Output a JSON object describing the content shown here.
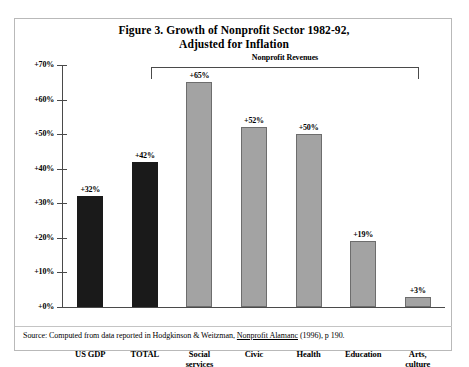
{
  "figure": {
    "title_line1": "Figure 3. Growth of Nonprofit Sector 1982-92,",
    "title_line2": "Adjusted for Inflation",
    "bracket_label": "Nonprofit Revenues",
    "source_prefix": "Source: Computed from data reported in Hodgkinson & Weitzman, ",
    "source_italic": "Nonprofit Alamanc",
    "source_suffix": " (1996), p 190.",
    "colors": {
      "dark_bar": "#1a1a1a",
      "gray_bar": "#a3a3a3",
      "axis": "#4a4a4a",
      "frame": "#b9b9b9",
      "background": "#ffffff"
    }
  },
  "chart_data": {
    "type": "bar",
    "title": "Figure 3. Growth of Nonprofit Sector 1982-92, Adjusted for Inflation",
    "xlabel": "",
    "ylabel": "",
    "ylim": [
      0,
      70
    ],
    "grid": false,
    "legend": "none",
    "yticks": [
      "+0%",
      "+10%",
      "+20%",
      "+30%",
      "+40%",
      "+50%",
      "+60%",
      "+70%"
    ],
    "ytick_values": [
      0,
      10,
      20,
      30,
      40,
      50,
      60,
      70
    ],
    "categories": [
      "US GDP",
      "TOTAL",
      "Social services",
      "Civic",
      "Health",
      "Education",
      "Arts, culture"
    ],
    "values": [
      32,
      42,
      65,
      52,
      50,
      19,
      3
    ],
    "data_labels": [
      "+32%",
      "+42%",
      "+65%",
      "+52%",
      "+50%",
      "+19%",
      "+3%"
    ],
    "annotations": [
      {
        "text": "Nonprofit Revenues",
        "type": "bracket",
        "spans": [
          "TOTAL",
          "Social services",
          "Civic",
          "Health",
          "Education",
          "Arts, culture"
        ]
      }
    ],
    "series": [
      {
        "name": "Growth 1982-92 adjusted for inflation",
        "values": [
          32,
          42,
          65,
          52,
          50,
          19,
          3
        ]
      }
    ],
    "bars": [
      {
        "category_line1": "US GDP",
        "category_line2": "",
        "value": 32,
        "label": "+32%",
        "style": "dark"
      },
      {
        "category_line1": "TOTAL",
        "category_line2": "",
        "value": 42,
        "label": "+42%",
        "style": "dark"
      },
      {
        "category_line1": "Social",
        "category_line2": "services",
        "value": 65,
        "label": "+65%",
        "style": "gray"
      },
      {
        "category_line1": "Civic",
        "category_line2": "",
        "value": 52,
        "label": "+52%",
        "style": "gray"
      },
      {
        "category_line1": "Health",
        "category_line2": "",
        "value": 50,
        "label": "+50%",
        "style": "gray"
      },
      {
        "category_line1": "Education",
        "category_line2": "",
        "value": 19,
        "label": "+19%",
        "style": "gray"
      },
      {
        "category_line1": "Arts,",
        "category_line2": "culture",
        "value": 3,
        "label": "+3%",
        "style": "gray"
      }
    ]
  }
}
